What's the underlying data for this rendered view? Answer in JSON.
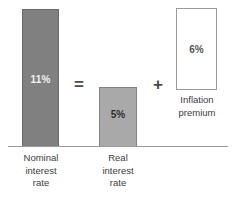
{
  "diagram": {
    "background_color": "#ffffff",
    "baseline_color": "#9a9a9a"
  },
  "chart_data": {
    "type": "bar",
    "title": "",
    "xlabel": "",
    "ylabel": "",
    "categories": [
      "Nominal interest rate",
      "Real interest rate",
      "Inflation premium"
    ],
    "values": [
      11,
      5,
      6
    ],
    "value_labels": [
      "11%",
      "5%",
      "6%"
    ],
    "ylim": [
      0,
      11
    ],
    "grid": false,
    "legend": "none",
    "series": [
      {
        "name": "Interest rate components",
        "values": [
          11,
          5,
          6
        ]
      }
    ]
  },
  "bars": {
    "nominal": {
      "value_label": "11%",
      "fill": "#808080",
      "stroke": "#6a6a6a",
      "caption_lines": [
        "Nominal",
        "interest",
        "rate"
      ]
    },
    "real": {
      "value_label": "5%",
      "fill": "#a9a9a9",
      "stroke": "#828282",
      "caption_lines": [
        "Real",
        "interest",
        "rate"
      ]
    },
    "inflation": {
      "value_label": "6%",
      "fill": "#ffffff",
      "stroke": "#9a9a9a",
      "caption_lines": [
        "Inflation",
        "premium"
      ]
    }
  },
  "operators": {
    "equals": "=",
    "plus": "+"
  }
}
